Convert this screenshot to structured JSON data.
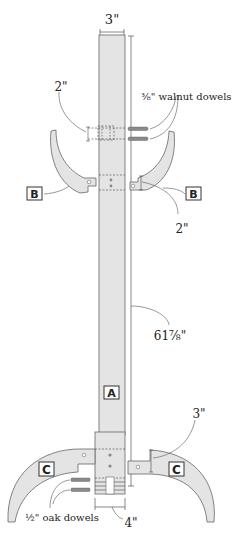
{
  "diagram": {
    "colors": {
      "wood": "#e4e4e4",
      "outline": "#666666",
      "dim_line": "#555555",
      "text": "#222222",
      "dowel": "#8a8a8a"
    },
    "dimensions": {
      "top_width": "3\"",
      "dowel_spacing_top": "2\"",
      "walnut_dowels": "⅜\" walnut dowels",
      "arm_offset": "2\"",
      "post_height": "61⅞\"",
      "foot_height": "3\"",
      "oak_dowels": "½\" oak dowels",
      "bottom_width": "4\""
    },
    "parts": {
      "post": "A",
      "arm_left": "B",
      "arm_right": "B",
      "foot_left": "C",
      "foot_right": "C"
    }
  }
}
